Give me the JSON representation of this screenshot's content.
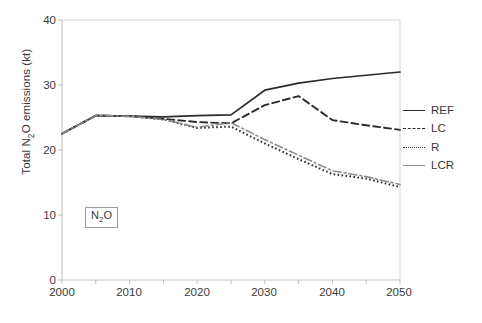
{
  "chart_data": {
    "type": "line",
    "title": "",
    "xlabel": "",
    "ylabel": "Total N2O emissions (kt)",
    "ylabel_parts": {
      "pre": "Total N",
      "sub": "2",
      "post": "O emissions (kt)"
    },
    "xlim": [
      2000,
      2050
    ],
    "ylim": [
      0,
      40
    ],
    "xticks": [
      2000,
      2010,
      2020,
      2030,
      2040,
      2050
    ],
    "xticks_minor": [
      2005,
      2015,
      2025,
      2035,
      2045
    ],
    "yticks": [
      0,
      10,
      20,
      30,
      40
    ],
    "grid": false,
    "legend_position": "right",
    "x": [
      2000,
      2005,
      2010,
      2015,
      2020,
      2025,
      2030,
      2035,
      2040,
      2045,
      2050
    ],
    "series": [
      {
        "name": "REF",
        "style": "solid",
        "color": "#2b2b2b",
        "values": [
          22.5,
          25.3,
          25.2,
          25.1,
          25.3,
          25.4,
          29.2,
          30.3,
          31.0,
          31.5,
          32.0
        ]
      },
      {
        "name": "LC",
        "style": "dashed",
        "color": "#2b2b2b",
        "values": [
          22.5,
          25.3,
          25.2,
          24.8,
          24.3,
          24.1,
          26.9,
          28.3,
          24.6,
          23.8,
          23.1
        ]
      },
      {
        "name": "R",
        "style": "dotted",
        "color": "#2b2b2b",
        "values": [
          22.5,
          25.3,
          25.2,
          24.7,
          23.4,
          23.6,
          21.0,
          18.6,
          16.3,
          15.6,
          14.3
        ]
      },
      {
        "name": "LCR",
        "style": "dashdot",
        "color": "#8d8d8d",
        "values": [
          22.5,
          25.3,
          25.2,
          24.7,
          23.5,
          24.2,
          21.6,
          19.2,
          16.8,
          15.9,
          14.7
        ]
      }
    ],
    "annotations": [
      {
        "name": "species-box",
        "text": "N2O",
        "parts": {
          "pre": "N",
          "sub": "2",
          "post": "O"
        },
        "x": 2006,
        "y": 10.5
      }
    ]
  },
  "legend": {
    "items": [
      {
        "label": "REF"
      },
      {
        "label": "LC"
      },
      {
        "label": "R"
      },
      {
        "label": "LCR"
      }
    ]
  },
  "caption": {
    "text": ""
  }
}
